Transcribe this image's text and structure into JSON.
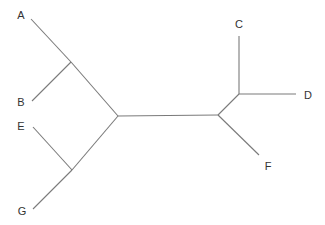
{
  "diagram": {
    "type": "unrooted-phylogenetic-tree",
    "line_color": "#7a7a7a",
    "label_color": "#333333",
    "nodes": {
      "n_AB": [
        71,
        62
      ],
      "n_EG": [
        72,
        170
      ],
      "n_center": [
        118,
        116
      ],
      "n_right": [
        218,
        115
      ],
      "n_CD": [
        239,
        94
      ]
    },
    "edges": [
      {
        "from": "A",
        "to": "n_AB",
        "x1": 31,
        "y1": 19,
        "x2": 71,
        "y2": 62
      },
      {
        "from": "B",
        "to": "n_AB",
        "x1": 32,
        "y1": 101,
        "x2": 71,
        "y2": 62
      },
      {
        "from": "n_AB",
        "to": "n_center",
        "x1": 71,
        "y1": 62,
        "x2": 118,
        "y2": 116
      },
      {
        "from": "E",
        "to": "n_EG",
        "x1": 33,
        "y1": 127,
        "x2": 72,
        "y2": 170
      },
      {
        "from": "G",
        "to": "n_EG",
        "x1": 33,
        "y1": 209,
        "x2": 72,
        "y2": 170
      },
      {
        "from": "n_EG",
        "to": "n_center",
        "x1": 72,
        "y1": 170,
        "x2": 118,
        "y2": 116
      },
      {
        "from": "n_center",
        "to": "n_right",
        "x1": 118,
        "y1": 116,
        "x2": 218,
        "y2": 115
      },
      {
        "from": "n_right",
        "to": "n_CD",
        "x1": 218,
        "y1": 115,
        "x2": 239,
        "y2": 94
      },
      {
        "from": "C",
        "to": "n_CD",
        "x1": 239,
        "y1": 36,
        "x2": 239,
        "y2": 94
      },
      {
        "from": "D",
        "to": "n_CD",
        "x1": 296,
        "y1": 94,
        "x2": 239,
        "y2": 94
      },
      {
        "from": "F",
        "to": "n_right",
        "x1": 259,
        "y1": 155,
        "x2": 218,
        "y2": 115
      }
    ],
    "leaves": [
      {
        "label": "A",
        "x": 21,
        "y": 15
      },
      {
        "label": "B",
        "x": 21,
        "y": 102
      },
      {
        "label": "C",
        "x": 239,
        "y": 24
      },
      {
        "label": "D",
        "x": 308,
        "y": 95
      },
      {
        "label": "E",
        "x": 21,
        "y": 126
      },
      {
        "label": "F",
        "x": 268,
        "y": 166
      },
      {
        "label": "G",
        "x": 22,
        "y": 211
      }
    ]
  }
}
